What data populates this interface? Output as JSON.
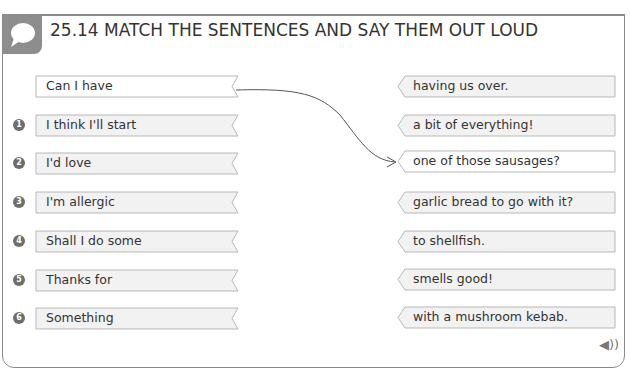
{
  "header": {
    "number": "25.14",
    "title": "25.14  MATCH THE SENTENCES AND SAY THEM OUT LOUD",
    "icon": "speech-bubble-icon"
  },
  "example": {
    "left": "Can I have",
    "right": "one of those sausages?"
  },
  "left_items": [
    {
      "num": "1",
      "text": "I think I'll start"
    },
    {
      "num": "2",
      "text": "I'd love"
    },
    {
      "num": "3",
      "text": "I'm allergic"
    },
    {
      "num": "4",
      "text": "Shall I do some"
    },
    {
      "num": "5",
      "text": "Thanks for"
    },
    {
      "num": "6",
      "text": "Something"
    }
  ],
  "right_items": [
    {
      "text": "having us over."
    },
    {
      "text": "a bit of everything!"
    },
    {
      "text": "one of those sausages?"
    },
    {
      "text": "garlic bread to go with it?"
    },
    {
      "text": "to shellfish."
    },
    {
      "text": "smells good!"
    },
    {
      "text": "with a mushroom kebab."
    }
  ],
  "footer": {
    "audio_icon": "speaker-icon",
    "audio_glyph": "◀))"
  },
  "colors": {
    "frame": "#8a8a8a",
    "badge": "#8d8d8d",
    "ribbon_fill": "#f2f2f2",
    "ribbon_border": "#b8b8b8"
  }
}
